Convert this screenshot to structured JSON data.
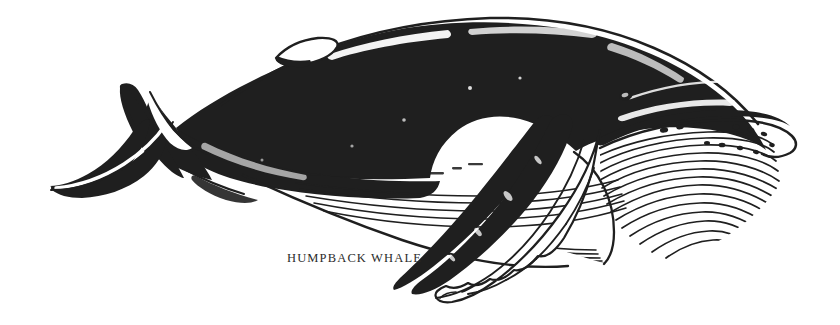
{
  "figure": {
    "title": "HUMPBACK WHALE",
    "medium": "pen-and-ink line illustration",
    "orientation": "left-facing-tail, right-facing-head",
    "caption": {
      "text": "HUMPBACK WHALE",
      "x": 287,
      "y": 252,
      "font_size_px": 12.5,
      "letter_spacing_px": 1.15
    },
    "canvas": {
      "width": 840,
      "height": 325,
      "background_color": "#ffffff"
    },
    "colors": {
      "ink": "#1f1f1f",
      "ink_soft": "#2b2b2b",
      "paper": "#ffffff",
      "caption": "#2b2b2b"
    },
    "parts": [
      {
        "name": "tail-fluke-upper-lobe",
        "label": "Upper tail fluke lobe",
        "fill": "dark"
      },
      {
        "name": "tail-fluke-lower-lobe",
        "label": "Lower tail fluke lobe",
        "fill": "dark"
      },
      {
        "name": "caudal-peduncle",
        "label": "Tail stock",
        "fill": "dark"
      },
      {
        "name": "dorsal-fin",
        "label": "Dorsal fin",
        "fill": "light-with-outline"
      },
      {
        "name": "dorsal-ridge",
        "label": "Dorsal ridge highlight",
        "fill": "outline"
      },
      {
        "name": "body-dark-dorsal",
        "label": "Dark dorsal body mass",
        "fill": "dark"
      },
      {
        "name": "ventral-pleats",
        "label": "Ventral throat pleats",
        "fill": "line-hatching",
        "line_count": 26
      },
      {
        "name": "rostrum-tubercles",
        "label": "Rostrum tubercles",
        "fill": "dots",
        "count": 11
      },
      {
        "name": "pectoral-flipper-far",
        "label": "Far pectoral flipper",
        "fill": "dark"
      },
      {
        "name": "pectoral-flipper-near",
        "label": "Near pectoral flipper",
        "fill": "light-with-outline"
      },
      {
        "name": "snout-tip",
        "label": "Snout tip",
        "fill": "outline"
      },
      {
        "name": "eye",
        "label": "Eye",
        "fill": "dark"
      }
    ]
  }
}
